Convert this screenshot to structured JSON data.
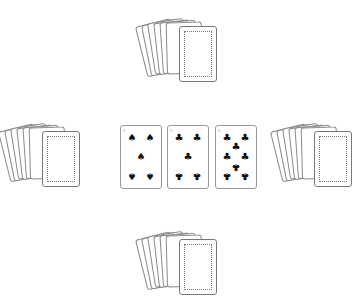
{
  "table": {
    "hands": [
      {
        "position": "top",
        "cards_face_down": 7
      },
      {
        "position": "left",
        "cards_face_down": 7
      },
      {
        "position": "right",
        "cards_face_down": 7
      },
      {
        "position": "bottom",
        "cards_face_down": 7
      }
    ],
    "center_cards": [
      {
        "rank": "5",
        "suit": "spades",
        "suit_symbol": "♠"
      },
      {
        "rank": "5",
        "suit": "clubs",
        "suit_symbol": "♣"
      },
      {
        "rank": "8",
        "suit": "clubs",
        "suit_symbol": "♣"
      }
    ]
  }
}
